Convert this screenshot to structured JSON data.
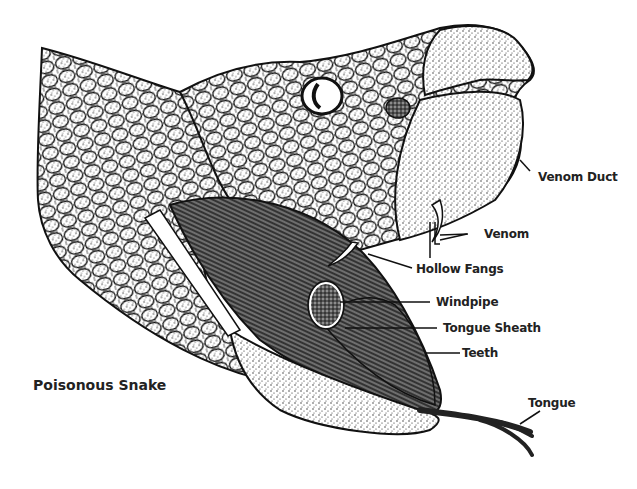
{
  "title": "Poisonous Snake",
  "labels": {
    "venom_duct": "Venom Duct",
    "venom": "Venom",
    "hollow_fangs": "Hollow Fangs",
    "windpipe": "Windpipe",
    "tongue_sheath": "Tongue Sheath",
    "teeth": "Teeth",
    "tongue": "Tongue"
  },
  "colors": {
    "ink": "#111111",
    "background": "#ffffff"
  }
}
